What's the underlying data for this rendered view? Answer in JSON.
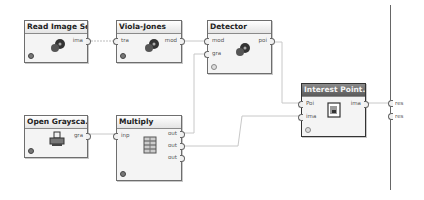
{
  "operators": [
    {
      "id": "read-image-set",
      "title": "Read Image Set",
      "inputs": [],
      "outputs": [
        "ima"
      ],
      "icon": "gears-icon"
    },
    {
      "id": "viola-jones",
      "title": "Viola-Jones",
      "inputs": [
        "tra"
      ],
      "outputs": [
        "mod"
      ],
      "icon": "gears-icon"
    },
    {
      "id": "detector",
      "title": "Detector",
      "inputs": [
        "mod",
        "gra"
      ],
      "outputs": [
        "poi"
      ],
      "icon": "gears-icon"
    },
    {
      "id": "interest-points",
      "title": "Interest Point...",
      "inputs": [
        "Poi",
        "ima"
      ],
      "outputs": [
        "ima"
      ],
      "icon": "image-icon",
      "selected": true
    },
    {
      "id": "open-grayscale",
      "title": "Open Graysca...",
      "inputs": [],
      "outputs": [
        "gra"
      ],
      "icon": "printer-icon"
    },
    {
      "id": "multiply",
      "title": "Multiply",
      "inputs": [
        "inp"
      ],
      "outputs": [
        "out",
        "out",
        "out"
      ],
      "icon": "stack-icon"
    }
  ],
  "result_ports": [
    "res",
    "res"
  ],
  "colors": {
    "wire": "#c8c8c8",
    "border": "#6e6e6e",
    "selected_header": "#6a6a6a"
  }
}
